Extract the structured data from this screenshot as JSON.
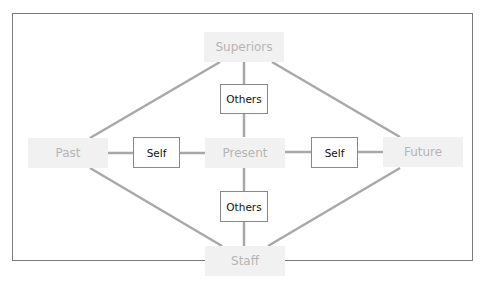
{
  "diagram": {
    "nodes": {
      "superiors": "Superiors",
      "past": "Past",
      "present": "Present",
      "future": "Future",
      "staff": "Staff"
    },
    "edge_labels": {
      "top_others": "Others",
      "left_self": "Self",
      "right_self": "Self",
      "bottom_others": "Others"
    },
    "colors": {
      "node_fill": "#f1f1f1",
      "node_text": "#b5b5b5",
      "line": "#a8a8a8",
      "label_border": "#888888"
    }
  }
}
